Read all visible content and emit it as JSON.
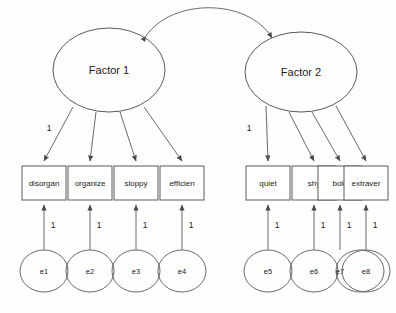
{
  "diagram": {
    "type": "sem-path-diagram",
    "background_color": "#fefefe",
    "stroke_color": "#6a6a6a",
    "text_color": "#1a1a1a"
  },
  "factors": [
    {
      "id": "factor1",
      "label": "Factor 1",
      "cx": 109,
      "cy": 70,
      "rx": 56,
      "ry": 42
    },
    {
      "id": "factor2",
      "label": "Factor 2",
      "cx": 301,
      "cy": 72,
      "rx": 56,
      "ry": 40
    }
  ],
  "indicators": [
    {
      "id": "ind1",
      "label": "disorgan",
      "x": 22,
      "y": 166,
      "w": 44,
      "h": 34,
      "factor": "factor1",
      "loading": "1"
    },
    {
      "id": "ind2",
      "label": "organize",
      "x": 68,
      "y": 166,
      "w": 44,
      "h": 34,
      "factor": "factor1",
      "loading": ""
    },
    {
      "id": "ind3",
      "label": "sloppy",
      "x": 114,
      "y": 166,
      "w": 44,
      "h": 34,
      "factor": "factor1",
      "loading": ""
    },
    {
      "id": "ind4",
      "label": "efficien",
      "x": 160,
      "y": 166,
      "w": 44,
      "h": 34,
      "factor": "factor1",
      "loading": ""
    },
    {
      "id": "ind5",
      "label": "quiet",
      "x": 246,
      "y": 166,
      "w": 44,
      "h": 34,
      "factor": "factor2",
      "loading": "1"
    },
    {
      "id": "ind6",
      "label": "shy",
      "x": 292,
      "y": 166,
      "w": 44,
      "h": 34,
      "factor": "factor2",
      "loading": ""
    },
    {
      "id": "ind7",
      "label": "bold",
      "x": 338,
      "y": 166,
      "w": 44,
      "h": 34,
      "factor": "factor2",
      "loading": ""
    },
    {
      "id": "ind8",
      "label": "extraver",
      "x": 344,
      "y": 166,
      "w": 44,
      "h": 34,
      "factor": "factor2",
      "loading": ""
    }
  ],
  "errors": [
    {
      "id": "e1",
      "label": "e1",
      "cx": 44,
      "cy": 271,
      "rx": 24,
      "ry": 21,
      "target": "ind1",
      "coefficient": "1"
    },
    {
      "id": "e2",
      "label": "e2",
      "cx": 90,
      "cy": 271,
      "rx": 24,
      "ry": 21,
      "target": "ind2",
      "coefficient": "1"
    },
    {
      "id": "e3",
      "label": "e3",
      "cx": 136,
      "cy": 271,
      "rx": 24,
      "ry": 21,
      "target": "ind3",
      "coefficient": "1"
    },
    {
      "id": "e4",
      "label": "e4",
      "cx": 182,
      "cy": 271,
      "rx": 24,
      "ry": 21,
      "target": "ind4",
      "coefficient": "1"
    },
    {
      "id": "e5",
      "label": "e5",
      "cx": 268,
      "cy": 271,
      "rx": 24,
      "ry": 21,
      "target": "ind5",
      "coefficient": "1"
    },
    {
      "id": "e6",
      "label": "e6",
      "cx": 314,
      "cy": 271,
      "rx": 24,
      "ry": 21,
      "target": "ind6",
      "coefficient": "1"
    },
    {
      "id": "e7",
      "label": "e7",
      "cx": 360,
      "cy": 271,
      "rx": 24,
      "ry": 21,
      "target": "ind7",
      "coefficient": "1"
    },
    {
      "id": "e8",
      "label": "e8",
      "cx": 366,
      "cy": 271,
      "rx": 24,
      "ry": 21,
      "target": "ind8",
      "coefficient": "1"
    }
  ],
  "covariance": {
    "from": "factor1",
    "to": "factor2",
    "label": "",
    "double_headed": true
  }
}
